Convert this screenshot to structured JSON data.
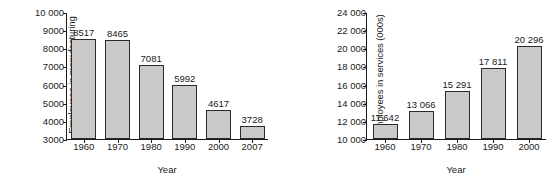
{
  "chart_data": [
    {
      "id": "manufacturing",
      "type": "bar",
      "title": "",
      "xlabel": "Year",
      "ylabel": "Employees in manufacturing\n(000s)",
      "categories": [
        "1960",
        "1970",
        "1980",
        "1990",
        "2000",
        "2007"
      ],
      "values": [
        8517,
        8465,
        7081,
        5992,
        4617,
        3728
      ],
      "value_labels": [
        "8517",
        "8465",
        "7081",
        "5992",
        "4617",
        "3728"
      ],
      "ylim": [
        3000,
        10000
      ],
      "ytick_step": 1000,
      "yticks": [
        3000,
        4000,
        5000,
        6000,
        7000,
        8000,
        9000,
        10000
      ],
      "ytick_labels": [
        "3000",
        "4000",
        "5000",
        "6000",
        "7000",
        "8000",
        "9000",
        "10 000"
      ],
      "grid": false,
      "legend": false,
      "bar_fill": "#c9c9c9",
      "bar_stroke": "#2b2b2b",
      "axis_color": "#1a1a1a"
    },
    {
      "id": "services",
      "type": "bar",
      "title": "",
      "xlabel": "Year",
      "ylabel": "Employees in services (000s)",
      "categories": [
        "1960",
        "1970",
        "1980",
        "1990",
        "2000"
      ],
      "values": [
        11642,
        13066,
        15291,
        17811,
        20296
      ],
      "value_labels": [
        "11 642",
        "13 066",
        "15 291",
        "17 811",
        "20 296"
      ],
      "ylim": [
        10000,
        24000
      ],
      "ytick_step": 2000,
      "yticks": [
        10000,
        12000,
        14000,
        16000,
        18000,
        20000,
        22000,
        24000
      ],
      "ytick_labels": [
        "10 000",
        "12 000",
        "14 000",
        "16 000",
        "18 000",
        "20 000",
        "22 000",
        "24 000"
      ],
      "grid": false,
      "legend": false,
      "bar_fill": "#c9c9c9",
      "bar_stroke": "#2b2b2b",
      "axis_color": "#1a1a1a"
    }
  ]
}
